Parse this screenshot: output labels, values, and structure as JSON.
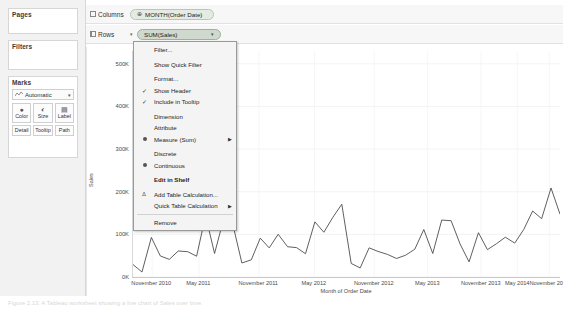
{
  "left_panel": {
    "pages": {
      "title": "Pages"
    },
    "filters": {
      "title": "Filters"
    },
    "marks": {
      "title": "Marks",
      "type_label": "Automatic",
      "type_caret": "▾",
      "buttons": [
        {
          "label": "Color",
          "icon": "color-palette-icon",
          "glyph": "⚙"
        },
        {
          "label": "Size",
          "icon": "size-icon",
          "glyph": "◔"
        },
        {
          "label": "Label",
          "icon": "label-icon",
          "glyph": "▤"
        },
        {
          "label": "Detail",
          "icon": "detail-icon",
          "glyph": ""
        },
        {
          "label": "Tooltip",
          "icon": "tooltip-icon",
          "glyph": ""
        },
        {
          "label": "Path",
          "icon": "path-icon",
          "glyph": ""
        }
      ]
    }
  },
  "shelves": {
    "columns": {
      "label": "Columns",
      "icon": "columns-icon",
      "pill": {
        "text": "MONTH(Order Date)",
        "prefix": "⊕",
        "caret": ""
      }
    },
    "rows": {
      "label": "Rows",
      "icon": "rows-icon",
      "caret": "▾",
      "pill": {
        "text": "SUM(Sales)",
        "prefix": "",
        "caret": "▾",
        "selected": true
      }
    }
  },
  "context_menu": {
    "items": [
      {
        "label": "Filter...",
        "type": "plain",
        "name": "menu-item-filter"
      },
      {
        "label": "",
        "type": "gap",
        "name": "menu-gap-1"
      },
      {
        "label": "Show Quick Filter",
        "type": "plain",
        "name": "menu-item-show-quick-filter"
      },
      {
        "label": "",
        "type": "gap",
        "name": "menu-gap-2"
      },
      {
        "label": "Format...",
        "type": "plain",
        "name": "menu-item-format"
      },
      {
        "label": "Show Header",
        "type": "check",
        "checked": true,
        "name": "menu-item-show-header"
      },
      {
        "label": "Include in Tooltip",
        "type": "check",
        "checked": true,
        "name": "menu-item-include-in-tooltip"
      },
      {
        "label": "",
        "type": "gap",
        "name": "menu-gap-3"
      },
      {
        "label": "Dimension",
        "type": "plain",
        "name": "menu-item-dimension"
      },
      {
        "label": "Attribute",
        "type": "plain",
        "name": "menu-item-attribute"
      },
      {
        "label": "Measure (Sum)",
        "type": "radio",
        "selected": true,
        "submenu": true,
        "name": "menu-item-measure-sum"
      },
      {
        "label": "",
        "type": "gap",
        "name": "menu-gap-4"
      },
      {
        "label": "Discrete",
        "type": "plain",
        "name": "menu-item-discrete"
      },
      {
        "label": "Continuous",
        "type": "radio",
        "selected": true,
        "name": "menu-item-continuous"
      },
      {
        "label": "",
        "type": "gap",
        "name": "menu-gap-5"
      },
      {
        "label": "Edit in Shelf",
        "type": "bold",
        "name": "menu-item-edit-in-shelf"
      },
      {
        "label": "",
        "type": "gap",
        "name": "menu-gap-6"
      },
      {
        "label": "Add Table Calculation...",
        "type": "icon",
        "glyph": "Δ",
        "name": "menu-item-add-table-calculation"
      },
      {
        "label": "Quick Table Calculation",
        "type": "plain",
        "submenu": true,
        "name": "menu-item-quick-table-calculation"
      },
      {
        "label": "",
        "type": "sep",
        "name": "menu-sep-1"
      },
      {
        "label": "Remove",
        "type": "plain",
        "name": "menu-item-remove"
      }
    ]
  },
  "caption": "Figure 2.13: A Tableau worksheet showing a line chart of Sales over time.",
  "chart_data": {
    "type": "line",
    "title": "",
    "xlabel": "Month of Order Date",
    "ylabel": "Sales",
    "ylim": [
      0,
      530000
    ],
    "yticks": [
      0,
      100000,
      200000,
      300000,
      400000,
      500000
    ],
    "ytick_labels": [
      "0K",
      "100K",
      "200K",
      "300K",
      "400K",
      "500K"
    ],
    "xtick_labels": [
      "November 2010",
      "May 2011",
      "November 2011",
      "May 2012",
      "November 2012",
      "May 2013",
      "November 2013",
      "May 2014",
      "November 2014"
    ],
    "xtick_positions": [
      0.045,
      0.155,
      0.295,
      0.425,
      0.565,
      0.69,
      0.815,
      0.9,
      0.975
    ],
    "grid": true,
    "line_color": "#4d4d4d",
    "series": [
      {
        "name": "SUM(Sales)",
        "x": [
          "2011-01",
          "2011-02",
          "2011-03",
          "2011-04",
          "2011-05",
          "2011-06",
          "2011-07",
          "2011-08",
          "2011-09",
          "2011-10",
          "2011-11",
          "2011-12",
          "2012-01",
          "2012-02",
          "2012-03",
          "2012-04",
          "2012-05",
          "2012-06",
          "2012-07",
          "2012-08",
          "2012-09",
          "2012-10",
          "2012-11",
          "2012-12",
          "2013-01",
          "2013-02",
          "2013-03",
          "2013-04",
          "2013-05",
          "2013-06",
          "2013-07",
          "2013-08",
          "2013-09",
          "2013-10",
          "2013-11",
          "2013-12",
          "2014-01",
          "2014-02",
          "2014-03",
          "2014-04",
          "2014-05",
          "2014-06",
          "2014-07",
          "2014-08",
          "2014-09",
          "2014-10",
          "2014-11",
          "2014-12"
        ],
        "values": [
          14236,
          4520,
          55691,
          28295,
          23648,
          34595,
          33946,
          27909,
          81777,
          31453,
          78629,
          69545,
          18542,
          22979,
          51715,
          38750,
          56987,
          40344,
          39262,
          31116,
          73410,
          59688,
          79412,
          96999,
          18174,
          11951,
          38726,
          34195,
          30132,
          24797,
          28765,
          36898,
          63100,
          31404,
          75972,
          74919,
          43971,
          20301,
          58872,
          36522,
          44261,
          52982,
          45264,
          63121,
          87866,
          77776,
          118448,
          83829
        ]
      }
    ],
    "plot_points": [
      [
        0.0,
        0.055
      ],
      [
        0.021,
        0.022
      ],
      [
        0.043,
        0.175
      ],
      [
        0.064,
        0.093
      ],
      [
        0.085,
        0.078
      ],
      [
        0.106,
        0.115
      ],
      [
        0.128,
        0.112
      ],
      [
        0.149,
        0.092
      ],
      [
        0.17,
        0.272
      ],
      [
        0.191,
        0.104
      ],
      [
        0.213,
        0.261
      ],
      [
        0.234,
        0.231
      ],
      [
        0.255,
        0.062
      ],
      [
        0.277,
        0.076
      ],
      [
        0.298,
        0.172
      ],
      [
        0.319,
        0.129
      ],
      [
        0.34,
        0.189
      ],
      [
        0.362,
        0.134
      ],
      [
        0.383,
        0.13
      ],
      [
        0.404,
        0.103
      ],
      [
        0.426,
        0.244
      ],
      [
        0.447,
        0.198
      ],
      [
        0.468,
        0.264
      ],
      [
        0.489,
        0.322
      ],
      [
        0.511,
        0.06
      ],
      [
        0.532,
        0.04
      ],
      [
        0.553,
        0.129
      ],
      [
        0.574,
        0.113
      ],
      [
        0.596,
        0.1
      ],
      [
        0.617,
        0.082
      ],
      [
        0.638,
        0.096
      ],
      [
        0.66,
        0.123
      ],
      [
        0.681,
        0.21
      ],
      [
        0.702,
        0.104
      ],
      [
        0.723,
        0.252
      ],
      [
        0.745,
        0.249
      ],
      [
        0.766,
        0.146
      ],
      [
        0.787,
        0.067
      ],
      [
        0.809,
        0.196
      ],
      [
        0.83,
        0.121
      ],
      [
        0.851,
        0.147
      ],
      [
        0.872,
        0.176
      ],
      [
        0.894,
        0.15
      ],
      [
        0.915,
        0.21
      ],
      [
        0.936,
        0.292
      ],
      [
        0.957,
        0.258
      ],
      [
        0.979,
        0.394
      ],
      [
        1.0,
        0.278
      ]
    ]
  }
}
